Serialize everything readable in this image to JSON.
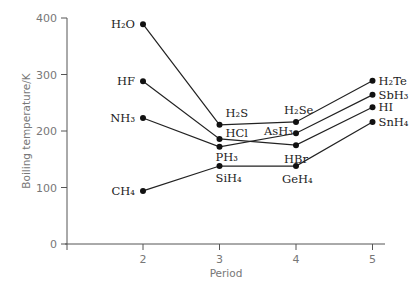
{
  "chart_data": {
    "type": "line",
    "title": "",
    "xlabel": "Period",
    "ylabel": "Boiling temperature/K",
    "x": [
      2,
      3,
      4,
      5
    ],
    "x_ticks": [
      "2",
      "3",
      "4",
      "5"
    ],
    "y_ticks": [
      "0",
      "100",
      "200",
      "300",
      "400"
    ],
    "ylim": [
      0,
      400
    ],
    "grid": false,
    "legend": "none (point labels inline)",
    "series": [
      {
        "name": "Group 16",
        "labels": [
          "H2O",
          "H2S",
          "H2Se",
          "H2Te"
        ],
        "values": [
          389,
          211,
          216,
          289
        ]
      },
      {
        "name": "Group 17",
        "labels": [
          "HF",
          "HCl",
          "HBr",
          "HI"
        ],
        "values": [
          288,
          186,
          175,
          242
        ]
      },
      {
        "name": "Group 15",
        "labels": [
          "NH3",
          "PH3",
          "AsH3",
          "SbH3"
        ],
        "values": [
          223,
          172,
          196,
          264
        ]
      },
      {
        "name": "Group 14",
        "labels": [
          "CH4",
          "SiH4",
          "GeH4",
          "SnH4"
        ],
        "values": [
          94,
          138,
          138,
          216
        ]
      }
    ]
  }
}
